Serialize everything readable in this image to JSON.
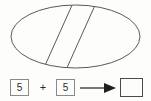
{
  "figure": {
    "shape": "ellipse",
    "shape_icon": "ellipse-icon",
    "partition_count": 3,
    "divider_count": 2,
    "divider_orientation": "parallel-diagonal",
    "stroke_color": "#595959",
    "fill_color": "#fdfdfc",
    "background_color": "#fdfdfc"
  },
  "equation": {
    "addend_1": "5",
    "operator": "+",
    "addend_2": "5",
    "arrow_icon": "right-arrow-icon",
    "sum": "",
    "sum_placeholder": "",
    "box_border_color": "#8a8a8a",
    "sum_border_color": "#4a4a4a",
    "text_color": "#2b2b2b"
  }
}
